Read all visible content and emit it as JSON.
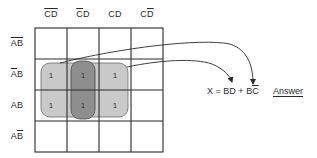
{
  "kmap": {
    "columns": [
      {
        "var1": "C",
        "var1_bar": true,
        "var2": "D",
        "var2_bar": true
      },
      {
        "var1": "C",
        "var1_bar": true,
        "var2": "D",
        "var2_bar": false
      },
      {
        "var1": "C",
        "var1_bar": false,
        "var2": "D",
        "var2_bar": false
      },
      {
        "var1": "C",
        "var1_bar": false,
        "var2": "D",
        "var2_bar": true
      }
    ],
    "rows": [
      {
        "var1": "A",
        "var1_bar": true,
        "var2": "B",
        "var2_bar": true
      },
      {
        "var1": "A",
        "var1_bar": true,
        "var2": "B",
        "var2_bar": false
      },
      {
        "var1": "A",
        "var1_bar": false,
        "var2": "B",
        "var2_bar": false
      },
      {
        "var1": "A",
        "var1_bar": false,
        "var2": "B",
        "var2_bar": true
      }
    ],
    "col_labels": [
      "CD",
      "CD",
      "CD",
      "CD"
    ],
    "row_labels": [
      "AB",
      "AB",
      "AB",
      "AB"
    ],
    "cells": [
      [
        "",
        "",
        "",
        ""
      ],
      [
        "1",
        "1",
        "1",
        ""
      ],
      [
        "1",
        "1",
        "1",
        ""
      ],
      [
        "",
        "",
        "",
        ""
      ]
    ],
    "groups": [
      {
        "name": "BC-bar group",
        "rows": [
          1,
          2
        ],
        "cols": [
          0,
          1,
          2
        ],
        "color": "#c9c9c9"
      },
      {
        "name": "BD group",
        "rows": [
          1,
          2
        ],
        "cols": [
          1
        ],
        "color": "#8e8e8e"
      }
    ]
  },
  "equation": {
    "lhs": "X",
    "eq": "=",
    "term1": "BD",
    "plus": "+",
    "term2_B": "B",
    "term2_C": "C"
  },
  "answer_label": "Answer",
  "colors": {
    "grid": "#2a2a2a",
    "outer_group": "#c9c9c9",
    "inner_group": "#8e8e8e",
    "text": "#2a2a2a"
  }
}
